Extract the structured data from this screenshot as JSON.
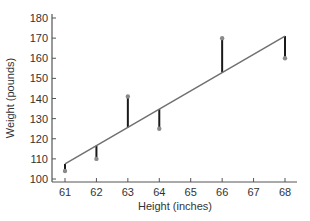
{
  "chart_data": {
    "type": "scatter",
    "title": "",
    "xlabel": "Height (inches)",
    "ylabel": "Weight (pounds)",
    "x_ticks": [
      61,
      62,
      63,
      64,
      65,
      66,
      67,
      68
    ],
    "y_ticks": [
      100,
      110,
      120,
      130,
      140,
      150,
      160,
      170,
      180
    ],
    "xlim": [
      61,
      68
    ],
    "ylim": [
      100,
      180
    ],
    "grid": false,
    "legend": null,
    "series": [
      {
        "name": "observed",
        "x": [
          61,
          62,
          63,
          64,
          66,
          68
        ],
        "y": [
          104,
          110,
          141,
          125,
          170,
          160
        ]
      }
    ],
    "regression_line": {
      "x": [
        61,
        68
      ],
      "y": [
        107.5,
        171
      ]
    },
    "residuals_shown": true,
    "colors": {
      "line": "#707070",
      "residual": "#1a1a1a",
      "point": "#8a8a8a",
      "axis": "#555555"
    }
  }
}
